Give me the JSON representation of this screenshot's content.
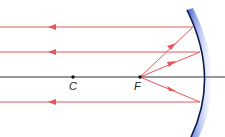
{
  "diagram": {
    "type": "concave-mirror-ray-diagram",
    "points": [
      {
        "label": "C",
        "x": 73,
        "y": 77
      },
      {
        "label": "F",
        "x": 140,
        "y": 77
      }
    ],
    "colors": {
      "ray": "#e8565a",
      "axis": "#333333",
      "mirror_edge": "#0d1b4a",
      "mirror_glow": "#4a6fe0"
    }
  }
}
